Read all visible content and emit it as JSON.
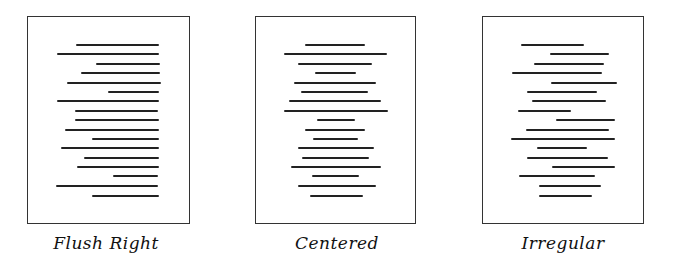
{
  "figure": {
    "panels": [
      {
        "id": "flush-right",
        "caption": "Flush Right",
        "box": {
          "x": 27,
          "y": 16,
          "w": 163,
          "h": 208
        },
        "caption_center_x": 106,
        "lines": [
          [
            76,
            159
          ],
          [
            57,
            159
          ],
          [
            96,
            160
          ],
          [
            81,
            160
          ],
          [
            67,
            161
          ],
          [
            108,
            159
          ],
          [
            57,
            159
          ],
          [
            75,
            158
          ],
          [
            75,
            159
          ],
          [
            65,
            159
          ],
          [
            92,
            159
          ],
          [
            61,
            159
          ],
          [
            84,
            159
          ],
          [
            77,
            159
          ],
          [
            113,
            158
          ],
          [
            56,
            158
          ],
          [
            92,
            159
          ]
        ]
      },
      {
        "id": "centered",
        "caption": "Centered",
        "box": {
          "x": 255,
          "y": 16,
          "w": 161,
          "h": 208
        },
        "caption_center_x": 337,
        "lines": [
          [
            305,
            365
          ],
          [
            284,
            387
          ],
          [
            298,
            372
          ],
          [
            315,
            356
          ],
          [
            294,
            376
          ],
          [
            301,
            368
          ],
          [
            289,
            381
          ],
          [
            284,
            388
          ],
          [
            317,
            355
          ],
          [
            305,
            365
          ],
          [
            313,
            358
          ],
          [
            298,
            374
          ],
          [
            302,
            369
          ],
          [
            291,
            381
          ],
          [
            312,
            359
          ],
          [
            298,
            376
          ],
          [
            310,
            363
          ]
        ]
      },
      {
        "id": "irregular",
        "caption": "Irregular",
        "box": {
          "x": 482,
          "y": 16,
          "w": 162,
          "h": 208
        },
        "caption_center_x": 563,
        "lines": [
          [
            521,
            584
          ],
          [
            550,
            609
          ],
          [
            534,
            604
          ],
          [
            512,
            602
          ],
          [
            551,
            617
          ],
          [
            527,
            597
          ],
          [
            532,
            606
          ],
          [
            518,
            571
          ],
          [
            556,
            615
          ],
          [
            526,
            609
          ],
          [
            511,
            615
          ],
          [
            537,
            587
          ],
          [
            527,
            608
          ],
          [
            552,
            615
          ],
          [
            519,
            595
          ],
          [
            539,
            601
          ],
          [
            539,
            592
          ]
        ]
      }
    ],
    "line_y": [
      45,
      54,
      64,
      73,
      83,
      92,
      101,
      111,
      120,
      130,
      139,
      148,
      158,
      167,
      176,
      186,
      196
    ]
  }
}
